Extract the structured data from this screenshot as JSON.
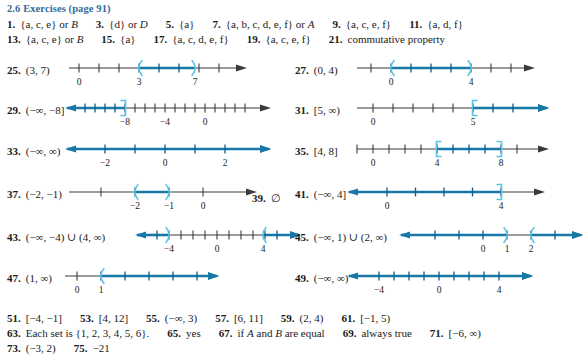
{
  "header": {
    "title": "2.6 Exercises (page 91)",
    "color": "#2f6b9a"
  },
  "text_rows": [
    {
      "id": "row-1",
      "top": 18,
      "items": [
        {
          "num": "1.",
          "text": "{a, c, e}   or   B",
          "italic_tail": "B"
        },
        {
          "num": "3.",
          "text": "{d}   or   D"
        },
        {
          "num": "5.",
          "text": "{a}"
        },
        {
          "num": "7.",
          "text": "{a, b, c, d, e, f}   or   A"
        },
        {
          "num": "9.",
          "text": "{a, c, e, f}"
        },
        {
          "num": "11.",
          "text": "{a, d, f}"
        }
      ]
    },
    {
      "id": "row-2",
      "top": 33,
      "items": [
        {
          "num": "13.",
          "text": "{a, c, e}   or   B"
        },
        {
          "num": "15.",
          "text": "{a}"
        },
        {
          "num": "17.",
          "text": "{a, c, d, e, f}"
        },
        {
          "num": "19.",
          "text": "{a, c, e, f}"
        },
        {
          "num": "21.",
          "text": "commutative property"
        }
      ]
    }
  ],
  "bottom_rows": [
    {
      "id": "row-b1",
      "top": 312,
      "items": [
        {
          "num": "51.",
          "text": "[−4, −1]"
        },
        {
          "num": "53.",
          "text": "[4, 12]"
        },
        {
          "num": "55.",
          "text": "(−∞, 3)"
        },
        {
          "num": "57.",
          "text": "[6, 11]"
        },
        {
          "num": "59.",
          "text": "(2, 4)"
        },
        {
          "num": "61.",
          "text": "[−1, 5)"
        }
      ]
    },
    {
      "id": "row-b2",
      "top": 327,
      "items": [
        {
          "num": "63.",
          "text": "Each set is {1, 2, 3, 4, 5, 6}."
        },
        {
          "num": "65.",
          "text": "yes"
        },
        {
          "num": "67.",
          "text": "if A and B are equal"
        },
        {
          "num": "69.",
          "text": "always true"
        },
        {
          "num": "71.",
          "text": "[−6, ∞)"
        }
      ]
    },
    {
      "id": "row-b3",
      "top": 342,
      "items": [
        {
          "num": "73.",
          "text": "(−3, 2)"
        },
        {
          "num": "75.",
          "text": "−21"
        }
      ]
    }
  ],
  "graphs": [
    {
      "id": "ex-25",
      "num": "25.",
      "interval": "(3, 7)",
      "col": "left",
      "top": 62,
      "label_w": 58,
      "axis": {
        "x0": 62,
        "x1": 218,
        "left_arrow": false,
        "right_arrow": true
      },
      "ticks": [
        {
          "x": 72,
          "label": "0"
        },
        {
          "x": 96,
          "label": ""
        },
        {
          "x": 120,
          "label": ""
        },
        {
          "x": 132,
          "label": "3"
        },
        {
          "x": 150,
          "label": ""
        },
        {
          "x": 168,
          "label": ""
        },
        {
          "x": 186,
          "label": ""
        },
        {
          "x": 188,
          "label": "7"
        },
        {
          "x": 206,
          "label": ""
        }
      ],
      "tick_labels": [
        {
          "x": 72,
          "t": "0"
        },
        {
          "x": 132,
          "t": "3"
        },
        {
          "x": 188,
          "t": "7"
        }
      ],
      "highlight": [
        {
          "x0": 132,
          "x1": 188
        }
      ],
      "brackets": [
        {
          "x": 132,
          "type": "paren-open"
        },
        {
          "x": 188,
          "type": "paren-close"
        }
      ]
    },
    {
      "id": "ex-27",
      "num": "27.",
      "interval": "(0, 4)",
      "col": "right",
      "top": 62,
      "axis": {
        "x0": 62,
        "x1": 218,
        "left_arrow": false,
        "right_arrow": true
      },
      "tick_labels": [
        {
          "x": 96,
          "t": "0"
        },
        {
          "x": 176,
          "t": "4"
        }
      ],
      "highlight": [
        {
          "x0": 96,
          "x1": 176
        }
      ],
      "brackets": [
        {
          "x": 96,
          "type": "paren-open"
        },
        {
          "x": 176,
          "type": "paren-close"
        }
      ]
    },
    {
      "id": "ex-29",
      "num": "29.",
      "interval": "(−∞, −8]",
      "col": "left",
      "top": 102,
      "axis": {
        "x0": 78,
        "x1": 242,
        "left_arrow": true,
        "right_arrow": true
      },
      "tick_labels": [
        {
          "x": 118,
          "t": "−8"
        },
        {
          "x": 158,
          "t": "−4"
        },
        {
          "x": 198,
          "t": "0"
        }
      ],
      "highlight": [
        {
          "x0": 78,
          "x1": 118
        }
      ],
      "brackets": [
        {
          "x": 118,
          "type": "bracket-close"
        }
      ]
    },
    {
      "id": "ex-31",
      "num": "31.",
      "interval": "[5, ∞)",
      "col": "right",
      "top": 102,
      "axis": {
        "x0": 62,
        "x1": 232,
        "left_arrow": false,
        "right_arrow": true
      },
      "tick_labels": [
        {
          "x": 78,
          "t": "0"
        },
        {
          "x": 178,
          "t": "5"
        }
      ],
      "highlight": [
        {
          "x0": 178,
          "x1": 232
        }
      ],
      "brackets": [
        {
          "x": 178,
          "type": "bracket-open"
        }
      ]
    },
    {
      "id": "ex-33",
      "num": "33.",
      "interval": "(−∞, ∞)",
      "col": "left",
      "top": 143,
      "axis": {
        "x0": 78,
        "x1": 242,
        "left_arrow": true,
        "right_arrow": true
      },
      "tick_labels": [
        {
          "x": 98,
          "t": "−2"
        },
        {
          "x": 158,
          "t": "0"
        },
        {
          "x": 218,
          "t": "2"
        }
      ],
      "highlight": [
        {
          "x0": 78,
          "x1": 242
        }
      ],
      "brackets": []
    },
    {
      "id": "ex-35",
      "num": "35.",
      "interval": "[4, 8]",
      "col": "right",
      "top": 143,
      "axis": {
        "x0": 62,
        "x1": 232,
        "left_arrow": false,
        "right_arrow": true
      },
      "tick_labels": [
        {
          "x": 78,
          "t": "0"
        },
        {
          "x": 142,
          "t": "4"
        },
        {
          "x": 206,
          "t": "8"
        }
      ],
      "highlight": [
        {
          "x0": 142,
          "x1": 206
        }
      ],
      "brackets": [
        {
          "x": 142,
          "type": "bracket-open"
        },
        {
          "x": 206,
          "type": "bracket-close"
        }
      ]
    },
    {
      "id": "ex-37",
      "num": "37.",
      "interval": "(−2, −1)",
      "col": "left",
      "top": 186,
      "axis": {
        "x0": 62,
        "x1": 228,
        "left_arrow": false,
        "right_arrow": true
      },
      "tick_labels": [
        {
          "x": 128,
          "t": "−2"
        },
        {
          "x": 162,
          "t": "−1"
        },
        {
          "x": 196,
          "t": "0"
        }
      ],
      "highlight": [
        {
          "x0": 128,
          "x1": 162
        }
      ],
      "brackets": [
        {
          "x": 128,
          "type": "paren-open"
        },
        {
          "x": 162,
          "type": "paren-close"
        }
      ]
    },
    {
      "id": "ex-39",
      "num": "39.",
      "interval": "∅",
      "col": "right-inline",
      "top": 190,
      "text_only": true
    },
    {
      "id": "ex-41",
      "num": "41.",
      "interval": "(−∞, 4]",
      "col": "right",
      "top": 186,
      "axis": {
        "x0": 72,
        "x1": 228,
        "left_arrow": true,
        "right_arrow": true
      },
      "tick_labels": [
        {
          "x": 92,
          "t": "0"
        },
        {
          "x": 206,
          "t": "4"
        }
      ],
      "highlight": [
        {
          "x0": 72,
          "x1": 206
        }
      ],
      "brackets": [
        {
          "x": 206,
          "type": "bracket-close"
        }
      ]
    },
    {
      "id": "ex-43",
      "num": "43.",
      "interval": "(−∞, −4) ∪ (4, ∞)",
      "col": "left",
      "top": 229,
      "axis": {
        "x0": 148,
        "x1": 272,
        "left_arrow": true,
        "right_arrow": true
      },
      "tick_labels": [
        {
          "x": 162,
          "t": "−4"
        },
        {
          "x": 210,
          "t": "0"
        },
        {
          "x": 256,
          "t": "4"
        }
      ],
      "highlight": [
        {
          "x0": 148,
          "x1": 162
        },
        {
          "x0": 256,
          "x1": 272
        }
      ],
      "brackets": [
        {
          "x": 162,
          "type": "paren-close"
        },
        {
          "x": 256,
          "type": "paren-open"
        }
      ]
    },
    {
      "id": "ex-45",
      "num": "45.",
      "interval": "(−∞, 1) ∪ (2, ∞)",
      "col": "right",
      "top": 229,
      "axis": {
        "x0": 124,
        "x1": 266,
        "left_arrow": true,
        "right_arrow": true
      },
      "tick_labels": [
        {
          "x": 188,
          "t": "0"
        },
        {
          "x": 212,
          "t": "1"
        },
        {
          "x": 236,
          "t": "2"
        }
      ],
      "highlight": [
        {
          "x0": 124,
          "x1": 212
        },
        {
          "x0": 236,
          "x1": 266
        }
      ],
      "brackets": [
        {
          "x": 212,
          "type": "paren-close"
        },
        {
          "x": 236,
          "type": "paren-open"
        }
      ]
    },
    {
      "id": "ex-47",
      "num": "47.",
      "interval": "(1, ∞)",
      "col": "left",
      "top": 270,
      "axis": {
        "x0": 58,
        "x1": 190,
        "left_arrow": false,
        "right_arrow": true
      },
      "tick_labels": [
        {
          "x": 70,
          "t": "0"
        },
        {
          "x": 94,
          "t": "1"
        }
      ],
      "highlight": [
        {
          "x0": 94,
          "x1": 190
        }
      ],
      "brackets": [
        {
          "x": 94,
          "type": "paren-open"
        }
      ]
    },
    {
      "id": "ex-49",
      "num": "49.",
      "interval": "(−∞, ∞)",
      "col": "right",
      "top": 270,
      "axis": {
        "x0": 72,
        "x1": 216,
        "left_arrow": true,
        "right_arrow": true
      },
      "tick_labels": [
        {
          "x": 84,
          "t": "−4"
        },
        {
          "x": 144,
          "t": "0"
        },
        {
          "x": 204,
          "t": "4"
        }
      ],
      "highlight": [
        {
          "x0": 72,
          "x1": 216
        }
      ],
      "brackets": []
    }
  ],
  "colors": {
    "highlight": "#1878a8",
    "bracket": "#5fc4e4",
    "axis": "#3b3b3b",
    "heading": "#2f6b9a"
  }
}
